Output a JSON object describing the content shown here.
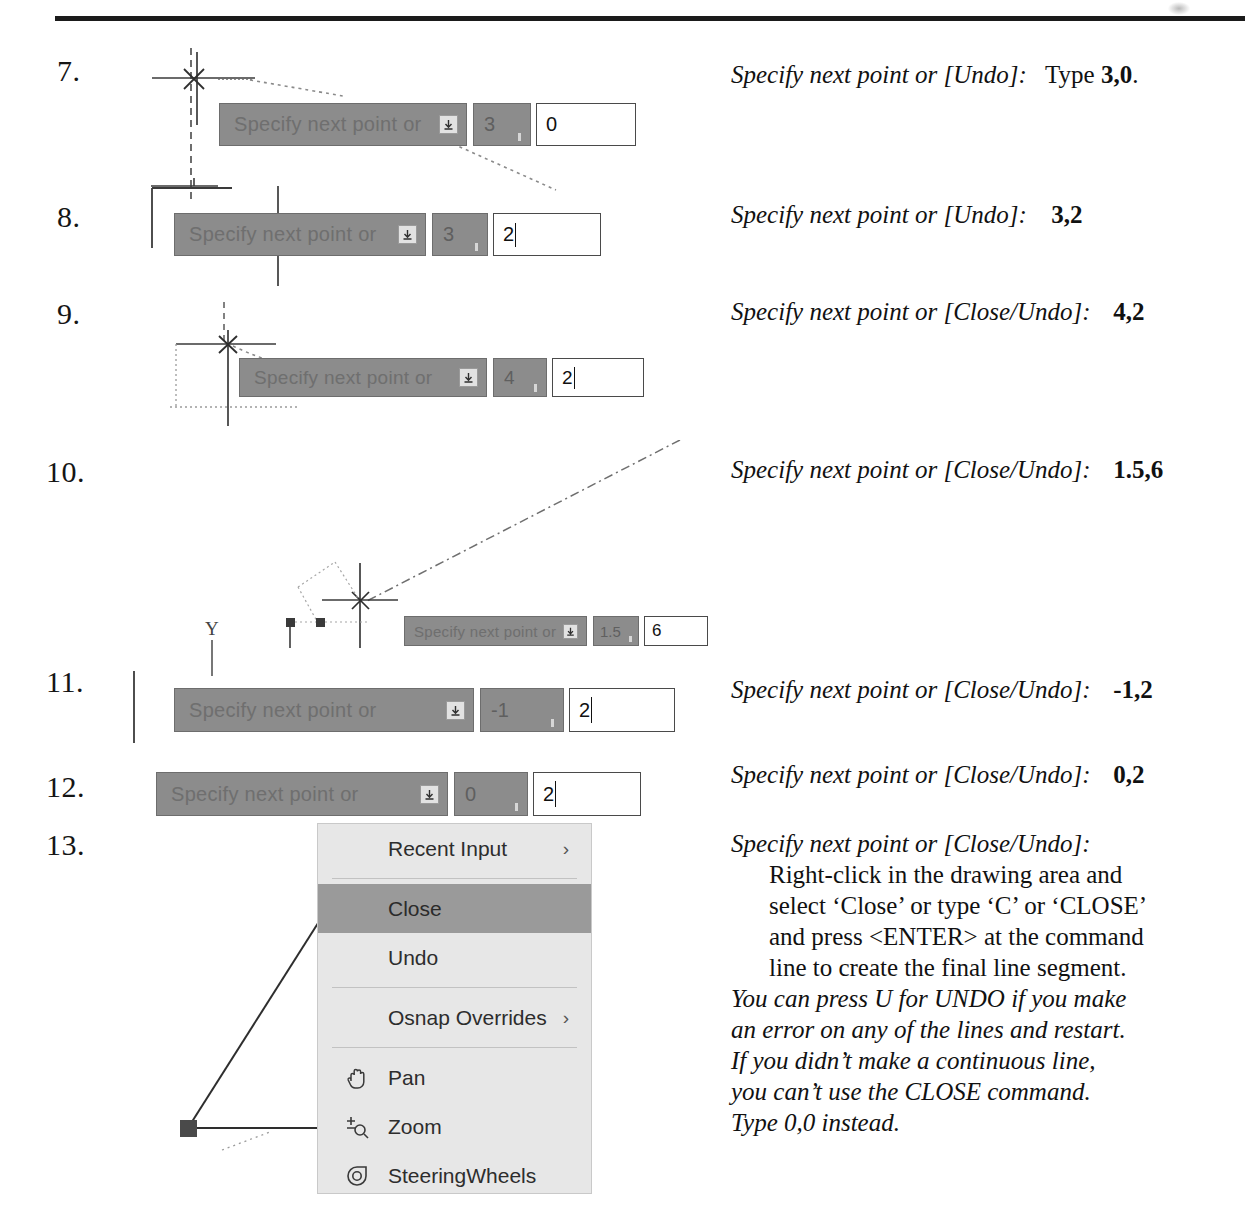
{
  "document": {
    "type": "scanned-tutorial-page",
    "prompt_label": "Specify next point or"
  },
  "steps": [
    {
      "number": "7.",
      "instruction_prefix": "Specify next point or [Undo]:",
      "instruction_suffix": "Type",
      "instruction_value": "3,0",
      "instruction_end": ".",
      "dyn": {
        "prompt": "Specify next point or",
        "x_value": "3",
        "y_value": "0"
      }
    },
    {
      "number": "8.",
      "instruction_prefix": "Specify next point or [Undo]:",
      "instruction_value": "3,2",
      "dyn": {
        "prompt": "Specify next point or",
        "x_value": "3",
        "y_value": "2"
      }
    },
    {
      "number": "9.",
      "instruction_prefix": "Specify next point or [Close/Undo]:",
      "instruction_value": "4,2",
      "dyn": {
        "prompt": "Specify next point or",
        "x_value": "4",
        "y_value": "2"
      }
    },
    {
      "number": "10.",
      "instruction_prefix": "Specify next point or [Close/Undo]:",
      "instruction_value": "1.5,6",
      "dyn": {
        "prompt": "Specify next point or",
        "x_value": "1.5",
        "y_value": "6"
      },
      "axis_label": "Y"
    },
    {
      "number": "11.",
      "instruction_prefix": "Specify next point or [Close/Undo]:",
      "instruction_value": "-1,2",
      "dyn": {
        "prompt": "Specify next point or",
        "x_value": "-1",
        "y_value": "2"
      }
    },
    {
      "number": "12.",
      "instruction_prefix": "Specify next point or [Close/Undo]:",
      "instruction_value": "0,2",
      "dyn": {
        "prompt": "Specify next point or",
        "x_value": "0",
        "y_value": "2"
      }
    },
    {
      "number": "13.",
      "instruction_prefix": "Specify next point or [Close/Undo]:",
      "body_lines": [
        "Right-click in the drawing area and",
        "select ‘Close’ or type ‘C’ or ‘CLOSE’",
        "and press <ENTER> at the command",
        "line to create the final line segment."
      ],
      "note_lines": [
        "You can press U for UNDO if you make",
        "an error on any of the lines and restart.",
        "If you didn’t make a continuous line,",
        "you can’t use the CLOSE command.",
        "Type 0,0 instead."
      ]
    }
  ],
  "context_menu": {
    "items": [
      {
        "label": "Recent Input",
        "submenu": "›",
        "icon": null,
        "selected": false
      },
      {
        "label": "Close",
        "submenu": "",
        "icon": null,
        "selected": true
      },
      {
        "label": "Undo",
        "submenu": "",
        "icon": null,
        "selected": false
      },
      {
        "label": "Osnap Overrides",
        "submenu": "›",
        "icon": null,
        "selected": false
      },
      {
        "label": "Pan",
        "submenu": "",
        "icon": "hand-icon",
        "selected": false
      },
      {
        "label": "Zoom",
        "submenu": "",
        "icon": "magnifier-plus-minus-icon",
        "selected": false
      },
      {
        "label": "SteeringWheels",
        "submenu": "",
        "icon": "steering-wheel-icon",
        "selected": false
      }
    ]
  },
  "colors": {
    "prompt_gray": "#8c8c8c",
    "menu_bg": "#e7e7e7",
    "menu_selected": "#9a9a9a",
    "rule": "#1b1b1b",
    "paper": "#ffffff"
  }
}
